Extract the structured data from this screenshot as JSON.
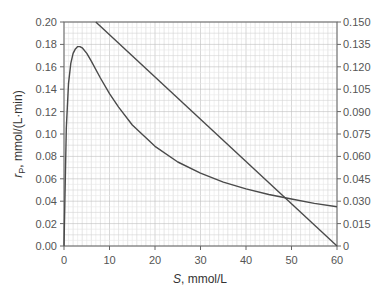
{
  "chart_data": {
    "type": "line",
    "title": "",
    "xlabel": "S, mmol/L",
    "xlabel_italic": "S",
    "xlabel_rest": ", mmol/L",
    "ylabel": "rP, mmol/(L·min)",
    "ylabel_italic": "r",
    "ylabel_sub": "P",
    "ylabel_rest": ", mmol/(L·min)",
    "xlim": [
      0,
      60
    ],
    "ylim": [
      0,
      0.2
    ],
    "y2lim": [
      0,
      0.15
    ],
    "grid": true,
    "x_ticks": [
      "0",
      "10",
      "20",
      "30",
      "40",
      "50",
      "60"
    ],
    "y_ticks": [
      "0.00",
      "0.02",
      "0.04",
      "0.06",
      "0.08",
      "0.10",
      "0.12",
      "0.14",
      "0.16",
      "0.18",
      "0.20"
    ],
    "y2_ticks": [
      "0",
      "0.015",
      "0.030",
      "0.045",
      "0.060",
      "0.075",
      "0.090",
      "0.105",
      "0.120",
      "0.135",
      "0.150"
    ],
    "series": [
      {
        "name": "rP vs S (curve, left axis)",
        "axis": "left",
        "x": [
          0,
          0.5,
          1,
          1.5,
          2,
          2.5,
          3,
          3.5,
          4,
          5,
          6,
          8,
          10,
          12,
          15,
          20,
          25,
          30,
          35,
          40,
          45,
          50,
          55,
          60
        ],
        "y": [
          0,
          0.105,
          0.145,
          0.163,
          0.172,
          0.176,
          0.178,
          0.178,
          0.177,
          0.172,
          0.165,
          0.15,
          0.136,
          0.124,
          0.108,
          0.089,
          0.075,
          0.065,
          0.057,
          0.051,
          0.046,
          0.042,
          0.038,
          0.035
        ]
      },
      {
        "name": "straight line (right axis)",
        "axis": "right",
        "x": [
          7,
          60
        ],
        "y": [
          0.15,
          0
        ]
      }
    ]
  }
}
